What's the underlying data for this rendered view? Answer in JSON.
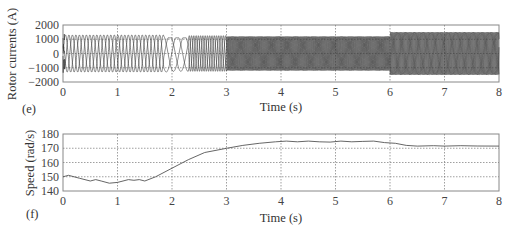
{
  "chart_data": [
    {
      "panel": "(e)",
      "type": "line",
      "title": "",
      "xlabel": "Time (s)",
      "ylabel": "Rotor currents (A)",
      "xlim": [
        0,
        8
      ],
      "ylim": [
        -2000,
        2000
      ],
      "xticks": [
        0,
        1,
        2,
        3,
        4,
        5,
        6,
        7,
        8
      ],
      "yticks": [
        -2000,
        -1000,
        0,
        1000,
        2000
      ],
      "ytick_labels": [
        "−2000",
        "−1000",
        "0",
        "1000",
        "2000"
      ],
      "grid": true,
      "description": "Three-phase rotor currents: ~1300 A amplitude sinusoids at low slip frequency (0-2 s), transient near 2 s, frequency increases after 2.5 s with ~1200 A amplitude, amplitude steps to ~1500 A at 6 s",
      "series": [
        {
          "name": "phase a",
          "segments": [
            {
              "t0": 0.0,
              "t1": 2.0,
              "amp": 1300,
              "freq_hz": 5.2
            },
            {
              "t0": 2.0,
              "t1": 3.0,
              "amp": 1250,
              "freq_hz": 8
            },
            {
              "t0": 3.0,
              "t1": 6.0,
              "amp": 1200,
              "freq_hz": 17
            },
            {
              "t0": 6.0,
              "t1": 8.0,
              "amp": 1500,
              "freq_hz": 16
            }
          ]
        },
        {
          "name": "phase b",
          "phase_shift_deg": 120
        },
        {
          "name": "phase c",
          "phase_shift_deg": 240
        }
      ]
    },
    {
      "panel": "(f)",
      "type": "line",
      "title": "",
      "xlabel": "Time (s)",
      "ylabel": "Speed (rad/s)",
      "xlim": [
        0,
        8
      ],
      "ylim": [
        140,
        180
      ],
      "xticks": [
        0,
        1,
        2,
        3,
        4,
        5,
        6,
        7,
        8
      ],
      "yticks": [
        140,
        150,
        160,
        170,
        180
      ],
      "ytick_labels": [
        "140",
        "150",
        "160",
        "170",
        "180"
      ],
      "grid": true,
      "series": [
        {
          "name": "speed",
          "x": [
            0,
            0.1,
            0.3,
            0.5,
            0.6,
            0.7,
            0.85,
            1.0,
            1.1,
            1.2,
            1.3,
            1.4,
            1.5,
            1.7,
            2.0,
            2.3,
            2.6,
            3.0,
            3.3,
            3.6,
            3.9,
            4.1,
            4.3,
            4.5,
            4.7,
            4.9,
            5.1,
            5.3,
            5.5,
            5.7,
            5.9,
            6.1,
            6.3,
            6.5,
            6.8,
            7.0,
            7.3,
            7.6,
            8.0
          ],
          "y": [
            150,
            151,
            149,
            147,
            148,
            147,
            145.5,
            146,
            147,
            148,
            147.5,
            148,
            147,
            150,
            156,
            162,
            167,
            170,
            172,
            173.5,
            174.5,
            175,
            174.5,
            175,
            174.5,
            174.3,
            175,
            174.5,
            174.8,
            175,
            174,
            173.5,
            172,
            171.5,
            171.8,
            171.5,
            171.8,
            171.6,
            171.5
          ]
        }
      ]
    }
  ],
  "panels": {
    "e": {
      "label": "(e)",
      "ylabel": "Rotor currents (A)",
      "xlabel": "Time (s)",
      "yticks": [
        "2000",
        "1000",
        "0",
        "−1000",
        "−2000"
      ],
      "xticks": [
        "0",
        "1",
        "2",
        "3",
        "4",
        "5",
        "6",
        "7",
        "8"
      ]
    },
    "f": {
      "label": "(f)",
      "ylabel": "Speed (rad/s)",
      "xlabel": "Time (s)",
      "yticks": [
        "180",
        "170",
        "160",
        "150",
        "140"
      ],
      "xticks": [
        "0",
        "1",
        "2",
        "3",
        "4",
        "5",
        "6",
        "7",
        "8"
      ]
    }
  },
  "colors": {
    "line": "#3a3a3a",
    "grid": "#888888",
    "axis": "#777777"
  }
}
